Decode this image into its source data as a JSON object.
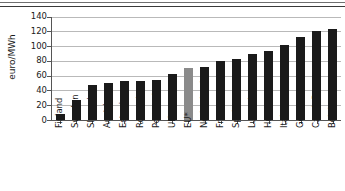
{
  "chart_data": {
    "type": "bar",
    "title": "",
    "xlabel": "",
    "ylabel": "euro/MWh",
    "ylim": [
      0,
      140
    ],
    "ytick_step": 20,
    "yticks": [
      0,
      20,
      40,
      60,
      80,
      100,
      120,
      140
    ],
    "grid": true,
    "legend": "none",
    "bar_color": "#1a1a1a",
    "highlight_color": "#8a8a8a",
    "highlight_category": "EU*",
    "categories": [
      "Finland",
      "Sweden",
      "Slovenia",
      "Austria",
      "Estonia",
      "Romania",
      "Portugal",
      "UK",
      "EU*",
      "Netherlands",
      "France",
      "Spain",
      "Luxembourg",
      "Hungary",
      "Italy",
      "Germany",
      "Czech Rep.",
      "Belgium"
    ],
    "values": [
      8,
      27,
      48,
      50,
      53,
      53,
      54,
      62,
      70,
      72,
      80,
      82,
      90,
      93,
      102,
      112,
      121,
      124
    ]
  }
}
